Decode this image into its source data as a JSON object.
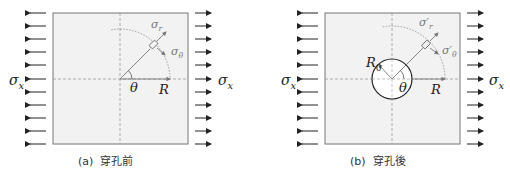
{
  "figure": {
    "panels": [
      {
        "id": "a",
        "caption_label": "(a)",
        "caption_text": "穿孔前",
        "labels": {
          "sigma_x_left": "σ",
          "sigma_x_left_sub": "x",
          "sigma_x_right": "σ",
          "sigma_x_right_sub": "x",
          "sigma_r": "σ",
          "sigma_r_sub": "r",
          "sigma_theta": "σ",
          "sigma_theta_sub": "θ",
          "theta": "θ",
          "radius": "R"
        }
      },
      {
        "id": "b",
        "caption_label": "(b)",
        "caption_text": "穿孔後",
        "labels": {
          "sigma_x_left": "σ",
          "sigma_x_left_sub": "x",
          "sigma_x_right": "σ",
          "sigma_x_right_sub": "x",
          "sigma_r": "σ′",
          "sigma_r_sub": "r",
          "sigma_theta": "σ′",
          "sigma_theta_sub": "θ",
          "theta": "θ",
          "radius": "R",
          "hole_radius": "R",
          "hole_radius_sub": "0"
        }
      }
    ],
    "arrow_count_per_side": 11,
    "colors": {
      "plate_fill": "#f2f2f2",
      "plate_border": "#777777",
      "arrow": "#222222",
      "dashed_axis": "#9a9a9a",
      "stress_grey": "#777777",
      "hole_fill": "#ffffff",
      "hole_border": "#222222"
    }
  }
}
